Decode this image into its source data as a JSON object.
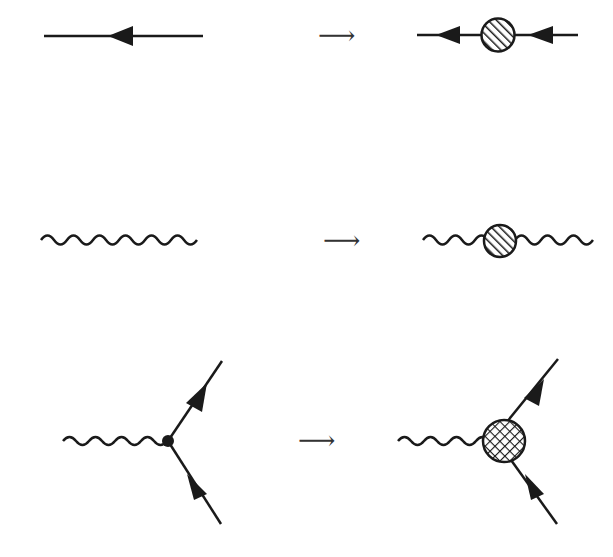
{
  "diagram": {
    "title": "",
    "colors": {
      "ink": "#1a1a1a",
      "background": "#ffffff"
    },
    "implies_symbol": "⟶",
    "rows": [
      {
        "id": "fermion-propagator",
        "left": "bare fermion line with arrow",
        "right": "dressed fermion line with hatched blob"
      },
      {
        "id": "photon-propagator",
        "left": "bare wavy photon line",
        "right": "dressed wavy photon line with hatched blob"
      },
      {
        "id": "vertex",
        "left": "bare vertex (dot) with photon and two fermion lines",
        "right": "full vertex with cross-hatched blob"
      }
    ]
  }
}
